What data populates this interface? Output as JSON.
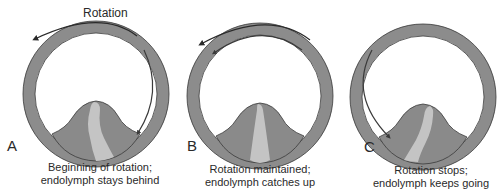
{
  "figure": {
    "rotation_label": "Rotation",
    "colors": {
      "canal": "#8c8c8c",
      "cupula": "#8a8a8a",
      "cupula_highlight": "#c4c4c4",
      "outline": "#3a3a3a",
      "arrow": "#2a2a2a",
      "background": "#ffffff"
    },
    "panels": [
      {
        "label": "A",
        "caption_line1": "Beginning of rotation;",
        "caption_line2": "endolymph stays behind",
        "cupula_deflection": "right",
        "external_arrow": "counterclockwise rotation arrow above",
        "endolymph_arrow": "clockwise along right side of canal"
      },
      {
        "label": "B",
        "caption_line1": "Rotation maintained;",
        "caption_line2": "endolymph catches up",
        "cupula_deflection": "none",
        "external_arrow": "counterclockwise rotation arrow above",
        "endolymph_arrow": "counterclockwise along top of canal"
      },
      {
        "label": "C",
        "caption_line1": "Rotation stops;",
        "caption_line2": "endolymph keeps going",
        "cupula_deflection": "left",
        "external_arrow": "none",
        "endolymph_arrow": "counterclockwise along left side of canal"
      }
    ]
  }
}
